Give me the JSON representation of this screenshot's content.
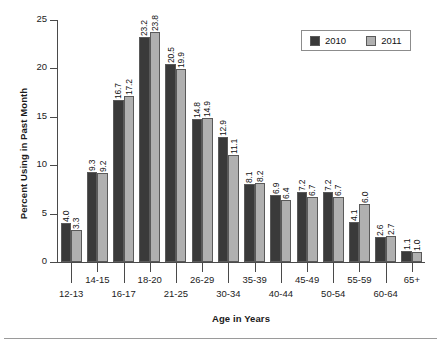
{
  "chart_data": {
    "type": "bar",
    "title": "",
    "subtitle": "",
    "xlabel": "Age in Years",
    "ylabel": "Percent Using in Past Month",
    "ylim": [
      0,
      25
    ],
    "yticks": [
      "0",
      "5",
      "10",
      "15",
      "20",
      "25"
    ],
    "grid": false,
    "legend_position": "top-right",
    "categories": [
      "12-13",
      "14-15",
      "16-17",
      "18-20",
      "21-25",
      "26-29",
      "30-34",
      "35-39",
      "40-44",
      "45-49",
      "50-54",
      "55-59",
      "60-64",
      "65+"
    ],
    "series": [
      {
        "name": "2010",
        "color": "#3a3a3a",
        "values": [
          4.0,
          9.3,
          16.7,
          23.2,
          20.5,
          14.8,
          12.9,
          8.1,
          6.9,
          7.2,
          7.2,
          4.1,
          2.6,
          1.1
        ]
      },
      {
        "name": "2011",
        "color": "#b0b0b0",
        "values": [
          3.3,
          9.2,
          17.2,
          23.8,
          19.9,
          14.9,
          11.1,
          8.2,
          6.4,
          6.7,
          6.7,
          6.0,
          2.7,
          1.0
        ]
      }
    ],
    "value_labels": [
      [
        "4.0",
        "3.3"
      ],
      [
        "9.3",
        "9.2"
      ],
      [
        "16.7",
        "17.2"
      ],
      [
        "23.2",
        "23.8"
      ],
      [
        "20.5",
        "19.9"
      ],
      [
        "14.8",
        "14.9"
      ],
      [
        "12.9",
        "11.1"
      ],
      [
        "8.1",
        "8.2"
      ],
      [
        "6.9",
        "6.4"
      ],
      [
        "7.2",
        "6.7"
      ],
      [
        "7.2",
        "6.7"
      ],
      [
        "4.1",
        "6.0"
      ],
      [
        "2.6",
        "2.7"
      ],
      [
        "1.1",
        "1.0"
      ]
    ]
  },
  "legend": {
    "items": [
      {
        "label": "2010",
        "color": "#3a3a3a"
      },
      {
        "label": "2011",
        "color": "#b0b0b0"
      }
    ]
  },
  "axes": {
    "y_title": "Percent Using in Past Month",
    "x_title": "Age in Years"
  }
}
